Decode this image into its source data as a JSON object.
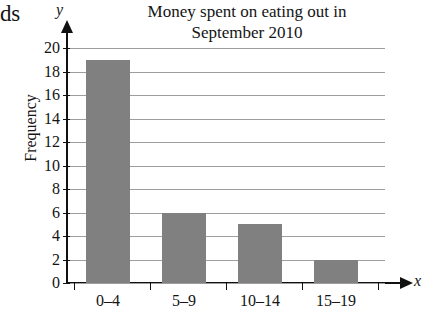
{
  "crop_fragment": "ds",
  "axis_letters": {
    "y": "y",
    "x": "x"
  },
  "chart_data": {
    "type": "bar",
    "title": "Money spent on eating out in September 2010",
    "title_lines": [
      "Money spent on eating out in",
      "September 2010"
    ],
    "categories": [
      "0–4",
      "5–9",
      "10–14",
      "15–19"
    ],
    "values": [
      19,
      6,
      5,
      2
    ],
    "xlabel": "x",
    "ylabel": "Frequency",
    "ylim": [
      0,
      20
    ],
    "ytick_step": 2,
    "yticks": [
      20,
      18,
      16,
      14,
      12,
      10,
      8,
      6,
      4,
      2,
      0
    ],
    "ytick_labels": [
      "20",
      "18",
      "16",
      "14",
      "12",
      "10",
      "8",
      "6",
      "4",
      "2",
      "0"
    ],
    "grid": true,
    "grid_axis": "y",
    "legend": false,
    "bar_color": "#808080",
    "axis_color": "#111111",
    "grid_color": "#9d9d9d"
  }
}
